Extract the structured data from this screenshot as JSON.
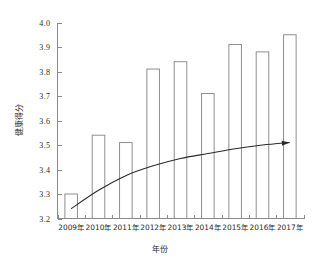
{
  "chart_data": {
    "type": "bar",
    "title": "",
    "xlabel": "年份",
    "ylabel": "健康得分",
    "categories": [
      "2009年",
      "2010年",
      "2011年",
      "2012年",
      "2013年",
      "2014年",
      "2015年",
      "2016年",
      "2017年"
    ],
    "values": [
      3.3,
      3.54,
      3.51,
      3.81,
      3.84,
      3.71,
      3.91,
      3.88,
      3.95
    ],
    "ylim": [
      3.2,
      4.0
    ],
    "ytick_labels": [
      "3.2",
      "3.3",
      "3.4",
      "3.5",
      "3.6",
      "3.7",
      "3.8",
      "3.9",
      "4.0"
    ],
    "ytick_values": [
      3.2,
      3.3,
      3.4,
      3.5,
      3.6,
      3.7,
      3.8,
      3.9,
      4.0
    ],
    "grid": false,
    "legend": null,
    "bar_fill_color": "#ffffff",
    "bar_edge_color": "#8f8f8f",
    "axis_color": "#8a8a8a",
    "trend_color": "#2b2b2b",
    "series": [
      {
        "name": "健康得分",
        "values": [
          3.3,
          3.54,
          3.51,
          3.81,
          3.84,
          3.71,
          3.91,
          3.88,
          3.95
        ]
      },
      {
        "name": "趋势线",
        "type": "line",
        "annotation": "arrow",
        "values": [
          3.24,
          3.315,
          3.375,
          3.415,
          3.445,
          3.465,
          3.485,
          3.5,
          3.51
        ]
      }
    ]
  },
  "axes": {
    "y_axis_title": "健康得分",
    "x_axis_title": "年份"
  }
}
